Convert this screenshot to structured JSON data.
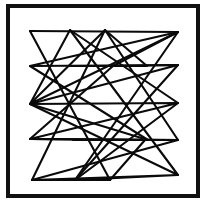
{
  "image": {
    "title": "Abstract zigzag line drawing",
    "width": 209,
    "height": 209,
    "background_color": "#ffffff",
    "ink_color": "#000000",
    "description": "A square black frame enclosing a dense set of overlapping zigzag polylines drawn in black on white."
  },
  "frame": {
    "name": "outer-border",
    "x": 8,
    "y": 6,
    "width": 190,
    "height": 190,
    "stroke_color": "#111111",
    "stroke_width": 4
  },
  "drawing": {
    "stroke_color": "#0a0a0a",
    "stroke_width": 2.1,
    "polylines": [
      {
        "name": "zigzag-path-1",
        "points": "30,31 178,32 30,66 178,65 30,104 178,103 30,139 178,140 32,180 110,180"
      },
      {
        "name": "zigzag-path-2",
        "points": "70,30 178,103 75,180 178,32 30,104 105,30 32,180"
      },
      {
        "name": "zigzag-path-3",
        "points": "105,30 178,140 30,139 113,66 70,66 147,66 105,30"
      },
      {
        "name": "zigzag-path-4",
        "points": "30,66 148,140 73,140 145,140 110,180 30,31"
      },
      {
        "name": "zigzag-path-5",
        "points": "178,65 75,180 178,175 32,180"
      },
      {
        "name": "zigzag-path-6",
        "points": "70,30 30,104 178,175 70,30"
      },
      {
        "name": "zigzag-path-7",
        "points": "178,32 113,66 178,65"
      },
      {
        "name": "zigzag-path-8",
        "points": "30,139 148,140 30,104"
      }
    ]
  }
}
